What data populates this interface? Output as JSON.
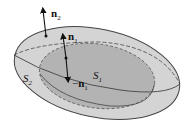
{
  "figure": {
    "surfaces": {
      "outer": {
        "label_main": "S",
        "label_sub": "2"
      },
      "inner": {
        "label_main": "S",
        "label_sub": "1"
      }
    },
    "normals": {
      "n2": {
        "label_main": "n",
        "label_sub": "2"
      },
      "n1": {
        "label_main": "n",
        "label_sub": "1"
      },
      "neg_n1": {
        "label_prefix": "−",
        "label_main": "n",
        "label_sub": "1"
      }
    },
    "colors": {
      "outer_fill": "#d4d4d4",
      "inner_fill": "#b3b3b3",
      "stroke": "#333333"
    }
  }
}
